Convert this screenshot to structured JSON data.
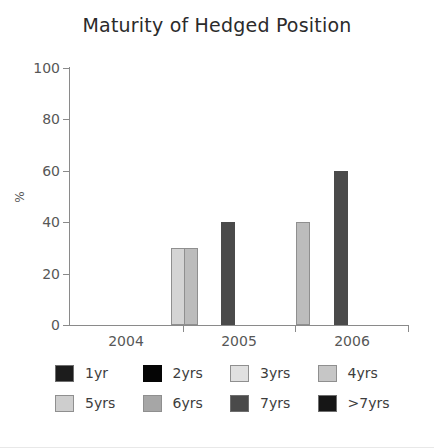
{
  "chart_data": {
    "type": "bar",
    "title": "Maturity of Hedged Position",
    "xlabel": "",
    "ylabel": "%",
    "categories": [
      "2004",
      "2005",
      "2006"
    ],
    "ylim": [
      0,
      100
    ],
    "yticks": [
      0,
      20,
      40,
      60,
      80,
      100
    ],
    "grid": false,
    "legend_position": "bottom",
    "series": [
      {
        "name": "1yr",
        "color": "#1c1c1c",
        "values": [
          0,
          0,
          0
        ]
      },
      {
        "name": "2yrs",
        "color": "#050505",
        "values": [
          0,
          0,
          0
        ]
      },
      {
        "name": "3yrs",
        "color": "#d4d4d4",
        "values": [
          30,
          0,
          0
        ]
      },
      {
        "name": "4yrs",
        "color": "#bcbcbc",
        "values": [
          30,
          40,
          0
        ]
      },
      {
        "name": "5yrs",
        "color": "#c4c4c4",
        "values": [
          0,
          0,
          0
        ]
      },
      {
        "name": "6yrs",
        "color": "#9a9a9a",
        "values": [
          0,
          0,
          0
        ]
      },
      {
        "name": "7yrs",
        "color": "#4a4a4a",
        "values": [
          40,
          60,
          100
        ]
      },
      {
        "name": ">7yrs",
        "color": "#161616",
        "values": [
          0,
          0,
          0
        ]
      }
    ]
  },
  "axes": {
    "y_tick_labels": [
      "0",
      "20",
      "40",
      "60",
      "80",
      "100"
    ],
    "y_axis_title": "%",
    "x_tick_labels": [
      "2004",
      "2005",
      "2006"
    ]
  },
  "legend": {
    "rows": [
      [
        {
          "label": "1yr",
          "color": "#1c1c1c",
          "border": "#6e6e6e"
        },
        {
          "label": "2yrs",
          "color": "#050505",
          "border": "#050505"
        },
        {
          "label": "3yrs",
          "color": "#e0e0e0",
          "border": "#8f8f8f"
        },
        {
          "label": "4yrs",
          "color": "#c6c6c6",
          "border": "#8f8f8f"
        }
      ],
      [
        {
          "label": "5yrs",
          "color": "#cecece",
          "border": "#8f8f8f"
        },
        {
          "label": "6yrs",
          "color": "#a6a6a6",
          "border": "#8f8f8f"
        },
        {
          "label": "7yrs",
          "color": "#4a4a4a",
          "border": "#6e6e6e"
        },
        {
          "label": ">7yrs",
          "color": "#161616",
          "border": "#6e6e6e"
        }
      ]
    ]
  }
}
